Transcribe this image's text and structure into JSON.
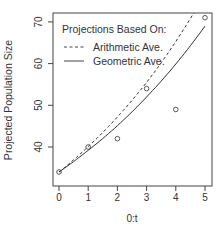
{
  "chart_data": {
    "type": "line",
    "title": "",
    "xlabel": "0:t",
    "ylabel": "Projected Population Size",
    "x": [
      0,
      1,
      2,
      3,
      4,
      5
    ],
    "xticks": [
      "0",
      "1",
      "2",
      "3",
      "4",
      "5"
    ],
    "yticks": [
      "40",
      "50",
      "60",
      "70"
    ],
    "xlim": [
      -0.2,
      5.2
    ],
    "ylim": [
      33,
      73
    ],
    "grid": false,
    "legend_position": "top-left",
    "legend_title": "Projections Based On:",
    "observed": {
      "name": "Observed",
      "style": "open-circles",
      "values": [
        34,
        40,
        42,
        54,
        49,
        71
      ]
    },
    "series": [
      {
        "name": "Arithmetic Ave.",
        "style": "dashed",
        "values": [
          34,
          40.1,
          47.2,
          55.5,
          65.3,
          76.8
        ]
      },
      {
        "name": "Geometric Ave.",
        "style": "solid",
        "values": [
          34,
          39.2,
          45.1,
          52.0,
          59.9,
          69.0
        ]
      }
    ]
  }
}
